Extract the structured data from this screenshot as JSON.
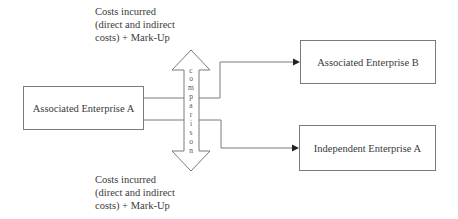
{
  "diagram": {
    "top_note": {
      "line1": "Costs incurred",
      "line2": "(direct and indirect",
      "line3": "costs)  +  Mark-Up"
    },
    "bottom_note": {
      "line1": "Costs incurred",
      "line2": "(direct and indirect",
      "line3": "costs)  +  Mark-Up"
    },
    "nodes": {
      "source": "Associated Enterprise A",
      "target_associated": "Associated Enterprise B",
      "target_independent": "Independent Enterprise A"
    },
    "comparison_arrow": {
      "label": "comparison",
      "letters": [
        "c",
        "o",
        "m",
        "p",
        "a",
        "r",
        "i",
        "s",
        "o",
        "n"
      ]
    },
    "edges": [
      {
        "from": "Associated Enterprise A",
        "to": "Associated Enterprise B"
      },
      {
        "from": "Associated Enterprise A",
        "to": "Independent Enterprise A"
      }
    ],
    "colors": {
      "line": "#7a7a7a",
      "text": "#3a3a3a",
      "arrowhead": "#222222"
    }
  }
}
